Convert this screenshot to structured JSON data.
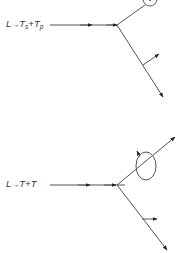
{
  "diagrams": [
    {
      "id": "upper",
      "label": {
        "lhs": "L",
        "arrow": "→",
        "term1": "T",
        "term1_sub": "s",
        "plus": "+",
        "term2": "T",
        "term2_sub": "p"
      },
      "description": "Decay of longitudinal phonon L into slow transverse T_s and fast transverse T_p phonons; one outgoing mode carries a circular polarization marker (cut off at top), the other shows a perpendicular polarization arrow"
    },
    {
      "id": "lower",
      "label": {
        "lhs": "L",
        "arrow": "→",
        "term1": "T",
        "plus": "+",
        "term2": "T"
      },
      "description": "Decay of longitudinal phonon L into two transverse T phonons; upper outgoing mode carries an elliptical (circular) polarization loop, lower outgoing mode shows a perpendicular polarization arrow"
    }
  ],
  "colors": {
    "line": "#555555",
    "arrowhead": "#222222",
    "text": "#333333",
    "background": "#ffffff"
  }
}
